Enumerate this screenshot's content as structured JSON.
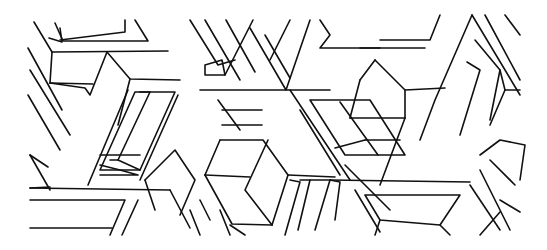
{
  "figure": {
    "kind": "isometric-geometric-line-pattern",
    "stroke_color": "#111111",
    "background_color": "#ffffff",
    "width": 547,
    "height": 250
  }
}
